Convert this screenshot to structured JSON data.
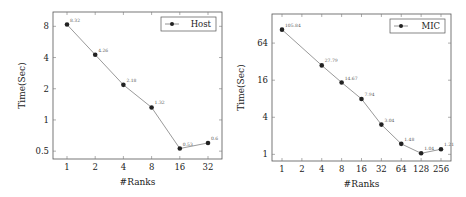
{
  "chart_data": [
    {
      "type": "line",
      "title": "",
      "xlabel": "#Ranks",
      "ylabel": "Time(Sec)",
      "xscale": "log2",
      "yscale": "log2",
      "x_ticks": [
        "1",
        "2",
        "4",
        "8",
        "16",
        "32"
      ],
      "y_ticks": [
        "0.5",
        "1",
        "2",
        "4",
        "8"
      ],
      "ylim": [
        0.42,
        11
      ],
      "legend_position": "top-right",
      "grid": false,
      "series": [
        {
          "name": "Host",
          "x": [
            1,
            2,
            4,
            8,
            16,
            32
          ],
          "values": [
            8.32,
            4.26,
            2.18,
            1.32,
            0.53,
            0.6
          ],
          "labels": [
            "8.32",
            "4.26",
            "2.18",
            "1.32",
            "0.53",
            "0.6"
          ]
        }
      ]
    },
    {
      "type": "line",
      "title": "",
      "xlabel": "#Ranks",
      "ylabel": "Time(Sec)",
      "xscale": "log2",
      "yscale": "log2",
      "x_ticks": [
        "1",
        "2",
        "4",
        "8",
        "16",
        "32",
        "64",
        "128",
        "256"
      ],
      "y_ticks": [
        "1",
        "4",
        "16",
        "64"
      ],
      "ylim": [
        0.78,
        190
      ],
      "legend_position": "top-right",
      "grid": false,
      "series": [
        {
          "name": "MIC",
          "x": [
            1,
            4,
            8,
            16,
            32,
            64,
            128,
            256
          ],
          "values": [
            105.84,
            27.79,
            14.67,
            7.94,
            3.04,
            1.48,
            1.04,
            1.21
          ],
          "labels": [
            "105.84",
            "27.79",
            "14.67",
            "7.94",
            "3.04",
            "1.48",
            "1.04",
            "1.21"
          ]
        }
      ]
    }
  ]
}
